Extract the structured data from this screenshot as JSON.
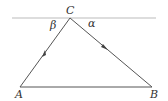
{
  "diagram": {
    "type": "triangle-with-parallel-line",
    "vertices": {
      "A": {
        "label": "A",
        "x": 20,
        "y": 87
      },
      "B": {
        "label": "B",
        "x": 152,
        "y": 87
      },
      "C": {
        "label": "C",
        "x": 70,
        "y": 18
      }
    },
    "angles": {
      "beta": {
        "label": "β"
      },
      "alpha": {
        "label": "α"
      }
    },
    "colors": {
      "line": "#555555",
      "top_line": "#bbbbbb",
      "text": "#333333"
    }
  }
}
